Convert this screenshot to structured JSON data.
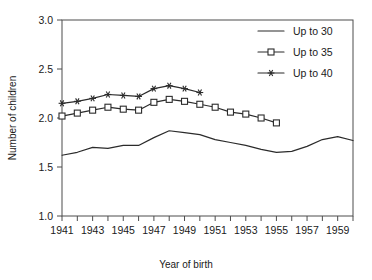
{
  "chart_data": {
    "type": "line",
    "title": "",
    "xlabel": "Year of birth",
    "ylabel": "Number of children",
    "xlim": [
      1941,
      1960
    ],
    "ylim": [
      1.0,
      3.0
    ],
    "grid": false,
    "legend_position": "top-right",
    "y_ticks": [
      "1.0",
      "1.5",
      "2.0",
      "2.5",
      "3.0"
    ],
    "y_tick_values": [
      1.0,
      1.5,
      2.0,
      2.5,
      3.0
    ],
    "x_ticks": [
      "1941",
      "1943",
      "1945",
      "1947",
      "1949",
      "1951",
      "1953",
      "1955",
      "1957",
      "1959"
    ],
    "x_tick_values": [
      1941,
      1943,
      1945,
      1947,
      1949,
      1951,
      1953,
      1955,
      1957,
      1959
    ],
    "x_minor_ticks": [
      1941,
      1942,
      1943,
      1944,
      1945,
      1946,
      1947,
      1948,
      1949,
      1950,
      1951,
      1952,
      1953,
      1954,
      1955,
      1956,
      1957,
      1958,
      1959,
      1960
    ],
    "series": [
      {
        "name": "Up to 30",
        "marker": "none",
        "x": [
          1941,
          1942,
          1943,
          1944,
          1945,
          1946,
          1947,
          1948,
          1949,
          1950,
          1951,
          1952,
          1953,
          1954,
          1955,
          1956,
          1957,
          1958,
          1959,
          1960
        ],
        "values": [
          1.62,
          1.65,
          1.7,
          1.69,
          1.72,
          1.72,
          1.8,
          1.87,
          1.85,
          1.83,
          1.78,
          1.75,
          1.72,
          1.68,
          1.65,
          1.66,
          1.71,
          1.78,
          1.81,
          1.77
        ]
      },
      {
        "name": "Up to 35",
        "marker": "square",
        "x": [
          1941,
          1942,
          1943,
          1944,
          1945,
          1946,
          1947,
          1948,
          1949,
          1950,
          1951,
          1952,
          1953,
          1954,
          1955
        ],
        "values": [
          2.02,
          2.05,
          2.08,
          2.11,
          2.09,
          2.08,
          2.16,
          2.19,
          2.17,
          2.14,
          2.11,
          2.06,
          2.04,
          2.0,
          1.95
        ]
      },
      {
        "name": "Up to 40",
        "marker": "star",
        "x": [
          1941,
          1942,
          1943,
          1944,
          1945,
          1946,
          1947,
          1948,
          1949,
          1950
        ],
        "values": [
          2.15,
          2.17,
          2.2,
          2.24,
          2.23,
          2.22,
          2.3,
          2.33,
          2.3,
          2.26
        ]
      }
    ]
  },
  "legend": {
    "items": [
      {
        "label": "Up to 30"
      },
      {
        "label": "Up to 35"
      },
      {
        "label": "Up to 40"
      }
    ]
  },
  "colors": {
    "line": "#2b2b2b",
    "axis": "#4d4d4d",
    "background": "#ffffff"
  }
}
